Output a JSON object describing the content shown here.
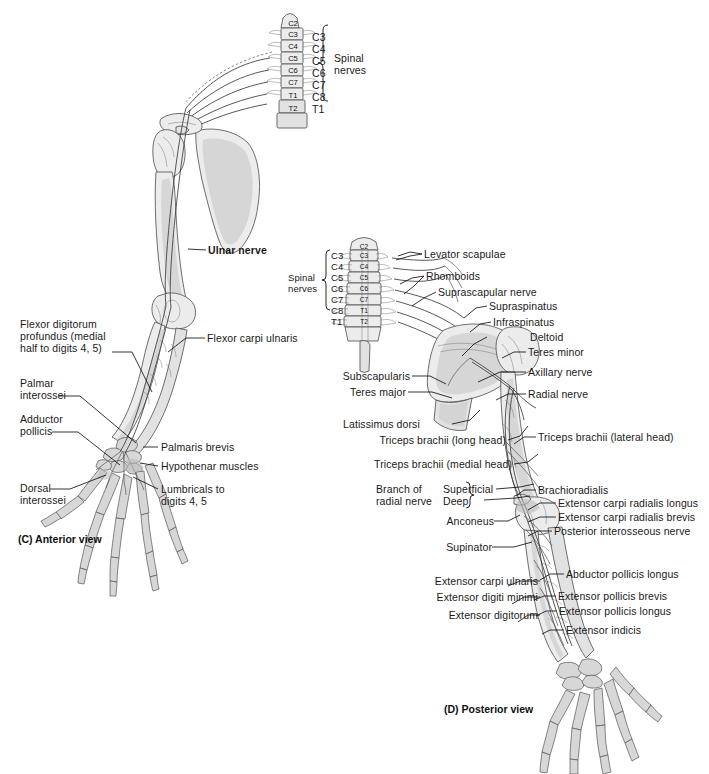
{
  "figure": {
    "background_color": "#ffffff",
    "ink_color": "#1a1a1a",
    "bone_fill": "#ececec"
  },
  "panel_c": {
    "caption": "(C) Anterior view",
    "spinal": {
      "bracket_label": "Spinal\nnerves",
      "bracket_label_line1": "Spinal",
      "bracket_label_line2": "nerves",
      "nerve_roots": [
        "C3",
        "C4",
        "C5",
        "C6",
        "C7",
        "C8",
        "T1"
      ],
      "vertebrae": [
        "C2",
        "C3",
        "C4",
        "C5",
        "C6",
        "C7",
        "T1",
        "T2"
      ]
    },
    "labels_right": [
      {
        "text": "Ulnar nerve",
        "bold": true
      },
      {
        "text": "Flexor carpi ulnaris",
        "bold": false
      },
      {
        "text": "Palmaris brevis",
        "bold": false
      },
      {
        "text": "Hypothenar muscles",
        "bold": false
      },
      {
        "text": "Lumbricals to\ndigits 4, 5",
        "bold": false
      }
    ],
    "labels_left": [
      {
        "text": "Flexor digitorum\nprofundus (medial\nhalf to digits 4, 5)"
      },
      {
        "text": "Palmar\ninterossei"
      },
      {
        "text": "Adductor\npollicis"
      },
      {
        "text": "Dorsal\ninterossei"
      }
    ],
    "label_text": {
      "ulnar_nerve": "Ulnar nerve",
      "flexor_carpi_ulnaris": "Flexor carpi ulnaris",
      "palmaris_brevis": "Palmaris brevis",
      "hypothenar_muscles": "Hypothenar muscles",
      "lumbricals_l1": "Lumbricals to",
      "lumbricals_l2": "digits 4, 5",
      "fdp_l1": "Flexor digitorum",
      "fdp_l2": "profundus (medial",
      "fdp_l3": "half to digits 4, 5)",
      "palmar_interossei_l1": "Palmar",
      "palmar_interossei_l2": "interossei",
      "adductor_pollicis_l1": "Adductor",
      "adductor_pollicis_l2": "pollicis",
      "dorsal_interossei_l1": "Dorsal",
      "dorsal_interossei_l2": "interossei"
    }
  },
  "panel_d": {
    "caption": "(D) Posterior view",
    "spinal": {
      "bracket_label_line1": "Spinal",
      "bracket_label_line2": "nerves",
      "nerve_roots": [
        "C3",
        "C4",
        "C5",
        "C6",
        "C7",
        "C8",
        "T1"
      ],
      "vertebrae": [
        "C2",
        "C3",
        "C4",
        "C5",
        "C6",
        "C7",
        "T1",
        "T2"
      ]
    },
    "label_text": {
      "levator_scapulae": "Levator scapulae",
      "rhomboids": "Rhomboids",
      "suprascapular_nerve": "Suprascapular nerve",
      "supraspinatus": "Supraspinatus",
      "infraspinatus": "Infraspinatus",
      "deltoid": "Deltoid",
      "teres_minor": "Teres minor",
      "axillary_nerve": "Axillary nerve",
      "radial_nerve": "Radial nerve",
      "subscapularis": "Subscapularis",
      "teres_major": "Teres major",
      "latissimus_dorsi": "Latissimus dorsi",
      "triceps_long_head": "Triceps brachii (long head)",
      "triceps_medial_head": "Triceps brachii (medial head)",
      "triceps_lateral_head": "Triceps brachii (lateral head)",
      "branch_of_l1": "Branch of",
      "branch_of_l2": "radial nerve",
      "superficial": "Superficial",
      "deep": "Deep",
      "anconeus": "Anconeus",
      "supinator": "Supinator",
      "brachioradialis": "Brachioradialis",
      "ecrl": "Extensor carpi radialis longus",
      "ecrb": "Extensor carpi radialis brevis",
      "posterior_interosseous_nerve": "Posterior interosseous nerve",
      "abductor_pollicis_longus": "Abductor pollicis longus",
      "extensor_pollicis_brevis": "Extensor pollicis brevis",
      "extensor_pollicis_longus": "Extensor pollicis longus",
      "extensor_indicis": "Extensor indicis",
      "extensor_carpi_ulnaris": "Extensor carpi ulnaris",
      "extensor_digiti_minimi": "Extensor digiti minimi",
      "extensor_digitorum": "Extensor digitorum"
    }
  }
}
